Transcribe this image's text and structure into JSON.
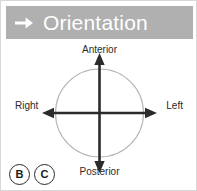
{
  "panel": {
    "border_color": "#d8d8d8",
    "background": "#ffffff"
  },
  "header": {
    "title": "Orientation",
    "icon": "right-arrow-icon",
    "background_color": "#b0b0b0",
    "text_color": "#ffffff"
  },
  "diagram": {
    "type": "anatomical-orientation-compass",
    "circle_color": "#b5b5b5",
    "axis_color": "#2b2b2b",
    "labels": {
      "top": "Anterior",
      "bottom": "Posterior",
      "left": "Right",
      "right": "Left"
    },
    "axes": [
      {
        "name": "vertical-axis",
        "from": "Posterior",
        "to": "Anterior",
        "double_headed": true
      },
      {
        "name": "horizontal-axis",
        "from": "Right",
        "to": "Left",
        "double_headed": true
      }
    ]
  },
  "badges": [
    {
      "label": "B"
    },
    {
      "label": "C"
    }
  ]
}
